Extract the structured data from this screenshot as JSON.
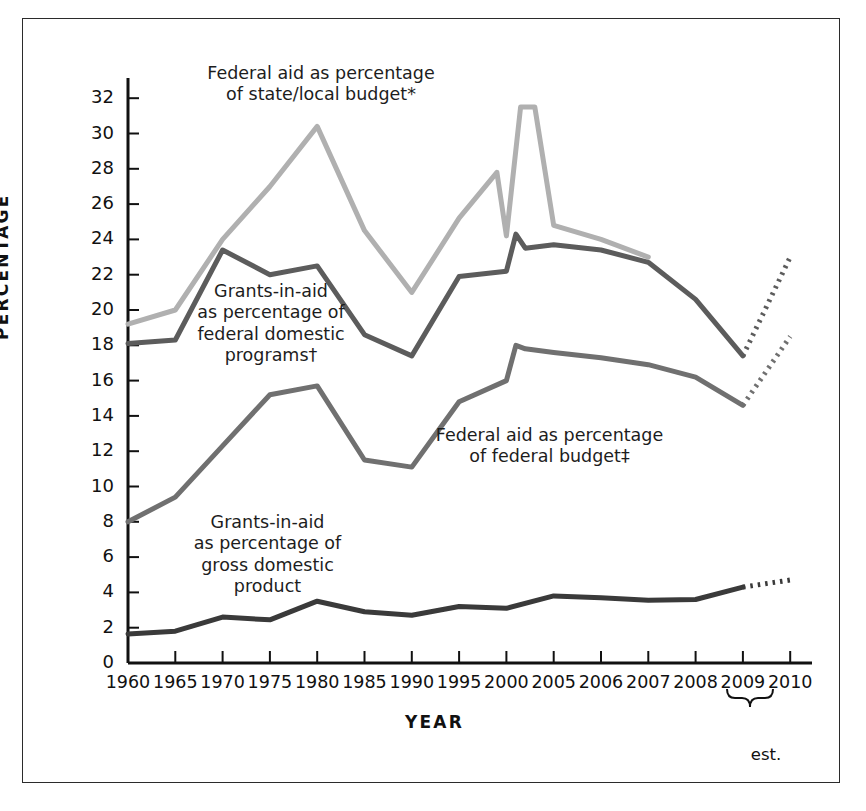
{
  "chart_data": {
    "type": "line",
    "title": "",
    "xlabel": "YEAR",
    "ylabel": "PERCENTAGE",
    "ylim": [
      0,
      32
    ],
    "y_ticks": [
      0,
      2,
      4,
      6,
      8,
      10,
      12,
      14,
      16,
      18,
      20,
      22,
      24,
      26,
      28,
      30,
      32
    ],
    "grid": false,
    "legend": "inline-annotations",
    "categories": [
      "1960",
      "1965",
      "1970",
      "1975",
      "1980",
      "1985",
      "1990",
      "1995",
      "2000",
      "2005",
      "2006",
      "2007",
      "2008",
      "2009",
      "2010"
    ],
    "x_tick_labels": [
      "1960",
      "1965",
      "1970",
      "1975",
      "1980",
      "1985",
      "1990",
      "1995",
      "2000",
      "2005",
      "2006",
      "2007",
      "2008",
      "2009",
      "2010"
    ],
    "estimate_note": "est.",
    "estimate_years": [
      "2009",
      "2010"
    ],
    "series": [
      {
        "name": "Federal aid as percentage of state/local budget*",
        "color": "#b0b0b0",
        "label_text": "Federal aid as percentage\nof state/local budget*",
        "values": [
          19.2,
          20.0,
          24.0,
          27.0,
          30.4,
          24.5,
          21.0,
          25.2,
          24.2,
          24.8,
          24.0,
          23.0,
          null,
          null,
          null
        ],
        "extra_points": [
          {
            "x": 1999.0,
            "y": 27.8
          },
          {
            "x": 2001.5,
            "y": 31.5
          },
          {
            "x": 2003.0,
            "y": 31.5
          }
        ],
        "dashed_segment": null
      },
      {
        "name": "Grants-in-aid as percentage of federal domestic programs†",
        "color": "#5c5c5c",
        "label_text": "Grants-in-aid\nas percentage of\nfederal domestic\nprograms†",
        "values": [
          18.1,
          18.3,
          23.4,
          22.0,
          22.5,
          18.6,
          17.4,
          21.9,
          22.2,
          23.7,
          23.4,
          22.7,
          20.6,
          17.4,
          null
        ],
        "extra_points": [
          {
            "x": 2001.0,
            "y": 24.3
          },
          {
            "x": 2002.0,
            "y": 23.5
          }
        ],
        "dashed_segment": {
          "from": [
            2009,
            17.4
          ],
          "to": [
            2010,
            23.0
          ]
        }
      },
      {
        "name": "Federal aid as percentage of federal budget‡",
        "color": "#707070",
        "label_text": "Federal aid as percentage\nof federal budget‡",
        "values": [
          8.0,
          9.4,
          12.3,
          15.2,
          15.7,
          11.5,
          11.1,
          14.8,
          16.0,
          17.6,
          17.3,
          16.9,
          16.2,
          14.6,
          null
        ],
        "extra_points": [
          {
            "x": 2001.0,
            "y": 18.0
          },
          {
            "x": 2002.0,
            "y": 17.8
          }
        ],
        "dashed_segment": {
          "from": [
            2009,
            14.6
          ],
          "to": [
            2010,
            18.5
          ]
        }
      },
      {
        "name": "Grants-in-aid as percentage of gross domestic product",
        "color": "#3a3a3a",
        "label_text": "Grants-in-aid\nas percentage of\ngross domestic\nproduct",
        "values": [
          1.65,
          1.8,
          2.6,
          2.45,
          3.5,
          2.9,
          2.7,
          3.2,
          3.1,
          3.8,
          3.7,
          3.55,
          3.6,
          4.3,
          null
        ],
        "extra_points": [],
        "dashed_segment": {
          "from": [
            2009,
            4.3
          ],
          "to": [
            2010,
            4.7
          ]
        }
      }
    ]
  },
  "axis": {
    "y_title": "PERCENTAGE",
    "x_title": "YEAR"
  },
  "annotations": {
    "state_local": "Federal aid as percentage\nof state/local budget*",
    "federal_programs": "Grants-in-aid\nas percentage of\nfederal domestic\nprograms†",
    "federal_budget": "Federal aid as percentage\nof federal budget‡",
    "gdp": "Grants-in-aid\nas percentage of\ngross domestic\nproduct",
    "estimate": "est."
  },
  "colors": {
    "state_local": "#b0b0b0",
    "federal_programs": "#5c5c5c",
    "federal_budget": "#707070",
    "gdp": "#3a3a3a",
    "axis": "#111111",
    "frame": "#2b2b2b"
  }
}
